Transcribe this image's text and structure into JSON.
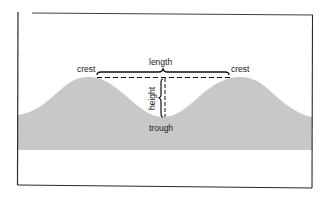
{
  "diagram": {
    "type": "wave-anatomy",
    "labels": {
      "crest_left": "crest",
      "crest_right": "crest",
      "length": "length",
      "height": "height",
      "trough": "trough"
    },
    "colors": {
      "wave_fill": "#c8c8c8",
      "frame": "#2a2a2a",
      "annotation": "#111111",
      "background": "#ffffff"
    }
  }
}
